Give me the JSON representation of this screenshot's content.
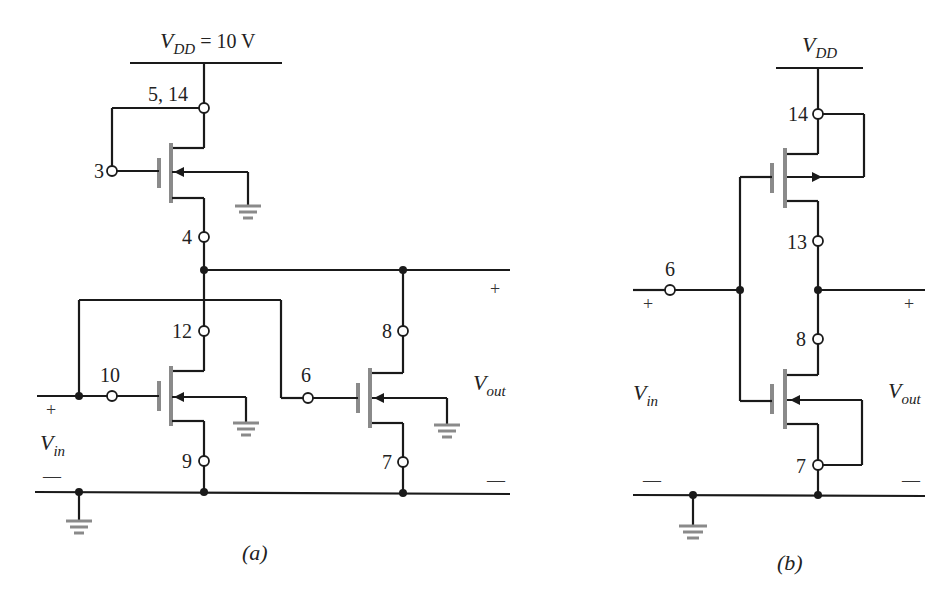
{
  "figure": {
    "panel_a": {
      "caption": "(a)",
      "supply_label_main": "V",
      "supply_label_sub": "DD",
      "supply_label_value": " = 10 V",
      "nodes": {
        "n5_14": "5, 14",
        "n3": "3",
        "n4": "4",
        "n12": "12",
        "n10": "10",
        "n9": "9",
        "n6": "6",
        "n8": "8",
        "n7": "7"
      },
      "input_label_main": "V",
      "input_label_sub": "in",
      "output_label_main": "V",
      "output_label_sub": "out",
      "plus": "+",
      "minus": "—"
    },
    "panel_b": {
      "caption": "(b)",
      "supply_label_main": "V",
      "supply_label_sub": "DD",
      "nodes": {
        "n14": "14",
        "n13": "13",
        "n6": "6",
        "n8": "8",
        "n7": "7"
      },
      "input_label_main": "V",
      "input_label_sub": "in",
      "output_label_main": "V",
      "output_label_sub": "out",
      "plus": "+",
      "minus": "—"
    }
  }
}
